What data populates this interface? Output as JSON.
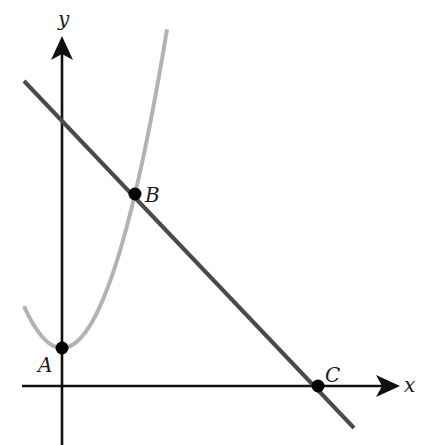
{
  "diagram": {
    "title": "",
    "axes": {
      "x_label": "x",
      "y_label": "y",
      "color": "#111111"
    },
    "curves": {
      "parabola": {
        "color": "#b3b3b3",
        "description": "upward-opening parabola with vertex A on the y-axis"
      },
      "line": {
        "color": "#4a4a4a",
        "description": "straight line with negative slope through B and C"
      }
    },
    "points": [
      {
        "name": "A",
        "label": "A",
        "description": "vertex of parabola, on y-axis"
      },
      {
        "name": "B",
        "label": "B",
        "description": "intersection of parabola and line"
      },
      {
        "name": "C",
        "label": "C",
        "description": "x-intercept of line"
      }
    ],
    "point_color": "#000000"
  }
}
